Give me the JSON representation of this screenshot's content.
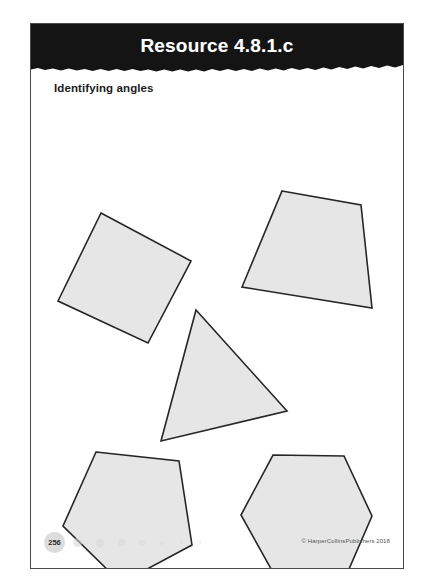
{
  "document": {
    "header": {
      "title": "Resource 4.8.1.c",
      "band_color": "#141414",
      "title_color": "#ffffff"
    },
    "subtitle": "Identifying angles",
    "page_background": "#ffffff",
    "border_color": "#4a4a4a"
  },
  "shapes": {
    "fill_color": "#e6e6e6",
    "stroke_color": "#262626",
    "items": [
      {
        "name": "square",
        "label": "tilted square",
        "points": "70,106 160,154 117,236 27,194"
      },
      {
        "name": "quadrilateral",
        "label": "irregular quadrilateral",
        "points": "251,84 330,98 341,201 211,180"
      },
      {
        "name": "triangle",
        "label": "scalene triangle",
        "points": "165,203 256,304 130,334"
      },
      {
        "name": "pentagon",
        "label": "irregular pentagon",
        "points": "65,345 148,354 161,438 90,476 32,419"
      },
      {
        "name": "hexagon",
        "label": "regular hexagon",
        "points": "242,348 313,349 341,409 315,469 244,469 210,408"
      }
    ]
  },
  "footer": {
    "page_number": "256",
    "copyright": "© HarperCollinsPublishers 2018",
    "dots": [
      {
        "size": 9,
        "opacity": 0.55
      },
      {
        "size": 8,
        "opacity": 0.5
      },
      {
        "size": 7,
        "opacity": 0.45
      },
      {
        "size": 5.5,
        "opacity": 0.4
      },
      {
        "size": 4,
        "opacity": 0.35
      },
      {
        "size": 3,
        "opacity": 0.3
      },
      {
        "size": 2.5,
        "opacity": 0.25
      }
    ]
  }
}
